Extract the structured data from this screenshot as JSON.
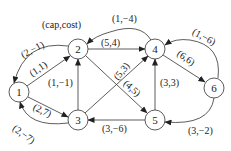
{
  "legend": "(cap,cost)",
  "nodes": [
    {
      "id": "1",
      "x": 19,
      "y": 92
    },
    {
      "id": "2",
      "x": 78,
      "y": 49
    },
    {
      "id": "3",
      "x": 78,
      "y": 120
    },
    {
      "id": "4",
      "x": 155,
      "y": 49
    },
    {
      "id": "5",
      "x": 155,
      "y": 120
    },
    {
      "id": "6",
      "x": 214,
      "y": 88
    }
  ],
  "edges": [
    {
      "from": "1",
      "to": "2",
      "label": "(1,1)"
    },
    {
      "from": "2",
      "to": "1",
      "label": "(2,−1)"
    },
    {
      "from": "1",
      "to": "3",
      "label": "(2,7)"
    },
    {
      "from": "3",
      "to": "1",
      "label": "(2,−7)"
    },
    {
      "from": "2",
      "to": "4",
      "label": "(5,4)"
    },
    {
      "from": "4",
      "to": "2",
      "label": "(1,−4)"
    },
    {
      "from": "3",
      "to": "2",
      "label": "(1,−1)"
    },
    {
      "from": "3",
      "to": "4",
      "label": "(5,3)"
    },
    {
      "from": "2",
      "to": "5",
      "label": "(4,5)"
    },
    {
      "from": "5",
      "to": "4",
      "label": "(3,3)"
    },
    {
      "from": "5",
      "to": "3",
      "label": "(3,−6)"
    },
    {
      "from": "4",
      "to": "6",
      "label": "(6,6)"
    },
    {
      "from": "6",
      "to": "4",
      "label": "(1,−6)"
    },
    {
      "from": "6",
      "to": "5",
      "label": "(3,−2)"
    }
  ]
}
